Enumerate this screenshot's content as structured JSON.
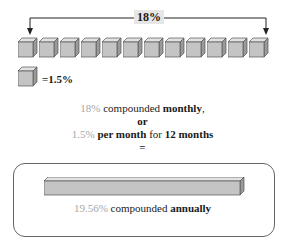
{
  "diagram": {
    "top_span_label": "18%",
    "cube_count": 12,
    "cube_color": "#c8c8c8",
    "legend": {
      "label": "=1.5%"
    },
    "explanation": {
      "line1": {
        "rate": "18%",
        "text": " compounded ",
        "emphasis": "monthly",
        "suffix": ","
      },
      "line2": {
        "text": "or"
      },
      "line3": {
        "rate": "1.5%",
        "emphasis1": " per month",
        "text": " for ",
        "emphasis2": "12 months"
      },
      "line4": {
        "text": "="
      }
    },
    "result": {
      "rate": "19.56%",
      "text": " compounded ",
      "emphasis": "annually"
    },
    "colors": {
      "muted_rate": "#a8a8a8",
      "box_border": "#666666",
      "label_bg": "#e6e6e6"
    }
  }
}
